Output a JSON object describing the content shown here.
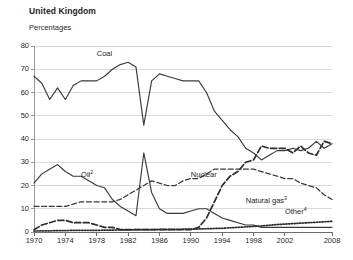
{
  "header": {
    "title": "United Kingdom",
    "subtitle": "Percentages"
  },
  "chart_data": {
    "type": "line",
    "title": "United Kingdom",
    "subtitle": "Percentages",
    "xlabel": "",
    "ylabel": "Percentages",
    "xlim": [
      1970,
      2008
    ],
    "ylim": [
      0,
      80
    ],
    "yticks": [
      0,
      10,
      20,
      30,
      40,
      50,
      60,
      70,
      80
    ],
    "xticks": [
      1970,
      1974,
      1978,
      1982,
      1986,
      1990,
      1994,
      1998,
      2002,
      2008
    ],
    "grid": "horizontal",
    "legend": "inline-annotations",
    "x": [
      1970,
      1971,
      1972,
      1973,
      1974,
      1975,
      1976,
      1977,
      1978,
      1979,
      1980,
      1981,
      1982,
      1983,
      1984,
      1985,
      1986,
      1987,
      1988,
      1989,
      1990,
      1991,
      1992,
      1993,
      1994,
      1995,
      1996,
      1997,
      1998,
      1999,
      2000,
      2001,
      2002,
      2003,
      2004,
      2005,
      2006,
      2007,
      2008
    ],
    "series": [
      {
        "name": "Coal",
        "style": "solid",
        "color": "#3a3a3a",
        "label": "Coal",
        "values": [
          67,
          64,
          57,
          62,
          57,
          63,
          65,
          65,
          65,
          67,
          70,
          72,
          73,
          71,
          46,
          65,
          68,
          67,
          66,
          65,
          65,
          65,
          60,
          52,
          48,
          44,
          41,
          36,
          34,
          31,
          33,
          35,
          35,
          36,
          35,
          36,
          39,
          36,
          38
        ]
      },
      {
        "name": "Oil",
        "style": "solid",
        "color": "#3a3a3a",
        "label": "Oil",
        "superscript": "2",
        "values": [
          21,
          25,
          27,
          29,
          26,
          24,
          24,
          22,
          20,
          19,
          14,
          11,
          9,
          7,
          34,
          17,
          10,
          8,
          8,
          8,
          9,
          10,
          10,
          8,
          6,
          5,
          4,
          3,
          3,
          2,
          2,
          2,
          2,
          2,
          2,
          2,
          2,
          2,
          2
        ]
      },
      {
        "name": "Nuclear",
        "style": "dashed",
        "color": "#3a3a3a",
        "label": "Nuclear",
        "values": [
          11,
          11,
          11,
          11,
          11,
          12,
          13,
          13,
          13,
          13,
          13,
          14,
          16,
          18,
          20,
          22,
          21,
          20,
          20,
          22,
          23,
          23,
          25,
          27,
          27,
          27,
          27,
          27,
          27,
          26,
          25,
          24,
          23,
          23,
          21,
          20,
          19,
          16,
          14
        ]
      },
      {
        "name": "Natural gas",
        "style": "dashed-bold",
        "color": "#2b2b2b",
        "label": "Natural gas",
        "superscript": "3",
        "values": [
          1,
          3,
          4,
          5,
          5,
          4,
          4,
          4,
          3,
          2,
          2,
          1,
          1,
          1,
          1,
          1,
          1,
          1,
          1,
          1,
          1,
          2,
          6,
          13,
          20,
          24,
          26,
          30,
          31,
          37,
          36,
          36,
          36,
          34,
          37,
          34,
          33,
          39,
          38
        ]
      },
      {
        "name": "Other",
        "style": "dotted",
        "color": "#2b2b2b",
        "label": "Other",
        "superscript": "4",
        "values": [
          0.4,
          0.5,
          0.5,
          0.6,
          0.6,
          0.7,
          0.7,
          0.7,
          0.7,
          0.8,
          0.8,
          0.9,
          0.9,
          1.0,
          1.0,
          1.0,
          1.1,
          1.1,
          1.1,
          1.2,
          1.2,
          1.3,
          1.4,
          1.5,
          1.6,
          1.8,
          2.0,
          2.2,
          2.4,
          2.6,
          2.9,
          3.2,
          3.4,
          3.6,
          3.8,
          4.0,
          4.2,
          4.4,
          4.6
        ]
      }
    ],
    "annotations": [
      {
        "text": "Coal",
        "x": 1978,
        "y": 76
      },
      {
        "text": "Oil",
        "x": 1976,
        "y": 24
      },
      {
        "text": "Nuclear",
        "x": 1990,
        "y": 24
      },
      {
        "text": "Natural gas",
        "x": 1997,
        "y": 13
      },
      {
        "text": "Other",
        "x": 2002,
        "y": 8
      }
    ]
  }
}
